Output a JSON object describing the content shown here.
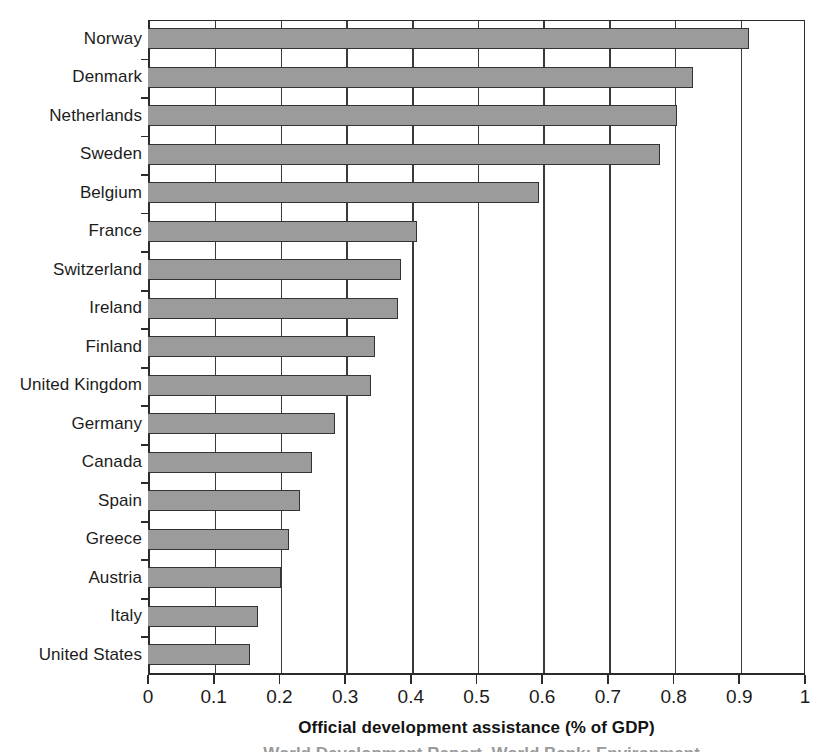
{
  "chart_data": {
    "type": "bar",
    "orientation": "horizontal",
    "title": "",
    "xlabel": "Official development assistance (% of GDP)",
    "ylabel": "",
    "xlim": [
      0,
      1
    ],
    "xticks": [
      "0",
      "0.1",
      "0.2",
      "0.3",
      "0.4",
      "0.5",
      "0.6",
      "0.7",
      "0.8",
      "0.9",
      "1"
    ],
    "xtick_values": [
      0,
      0.1,
      0.2,
      0.3,
      0.4,
      0.5,
      0.6,
      0.7,
      0.8,
      0.9,
      1
    ],
    "grid": "vertical",
    "legend": "none",
    "bar_color": "#9b9b9b",
    "bar_edge_color": "#333333",
    "axis_color": "#2b2b2b",
    "background": "#ffffff",
    "categories": [
      "Norway",
      "Denmark",
      "Netherlands",
      "Sweden",
      "Belgium",
      "France",
      "Switzerland",
      "Ireland",
      "Finland",
      "United Kingdom",
      "Germany",
      "Canada",
      "Spain",
      "Greece",
      "Austria",
      "Italy",
      "United States"
    ],
    "values": [
      0.915,
      0.83,
      0.805,
      0.78,
      0.595,
      0.41,
      0.385,
      0.38,
      0.345,
      0.34,
      0.285,
      0.25,
      0.232,
      0.215,
      0.202,
      0.168,
      0.155
    ]
  },
  "footer": {
    "cut_off_caption": "World Development Report, World Bank; Environment"
  }
}
